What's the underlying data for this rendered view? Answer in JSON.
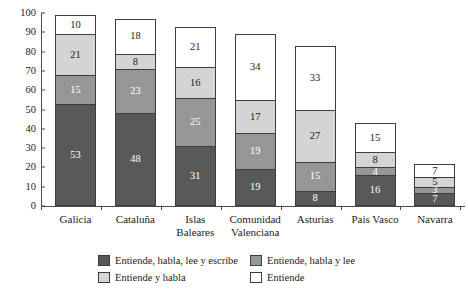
{
  "chart_data": {
    "type": "bar",
    "stacked": true,
    "title": "",
    "xlabel": "",
    "ylabel": "",
    "ylim": [
      0,
      100
    ],
    "yticks": [
      0,
      10,
      20,
      30,
      40,
      50,
      60,
      70,
      80,
      90,
      100
    ],
    "grid": false,
    "legend_position": "bottom",
    "categories": [
      "Galicia",
      "Cataluña",
      "Islas Baleares",
      "Comunidad Valenciana",
      "Asturias",
      "Pais Vasco",
      "Navarra"
    ],
    "category_lines": [
      [
        "Galicia"
      ],
      [
        "Cataluña"
      ],
      [
        "Islas",
        "Baleares"
      ],
      [
        "Comunidad",
        "Valenciana"
      ],
      [
        "Asturias"
      ],
      [
        "Pais Vasco"
      ],
      [
        "Navarra"
      ]
    ],
    "series": [
      {
        "name": "Entiende, habla, lee y escribe",
        "color": "#595959",
        "values": [
          53,
          48,
          31,
          19,
          8,
          16,
          7
        ]
      },
      {
        "name": "Entiende, habla y lee",
        "color": "#969696",
        "values": [
          15,
          23,
          25,
          19,
          15,
          4,
          3
        ]
      },
      {
        "name": "Entiende y habla",
        "color": "#d4d4d4",
        "values": [
          21,
          8,
          16,
          17,
          27,
          8,
          5
        ]
      },
      {
        "name": "Entiende",
        "color": "#ffffff",
        "values": [
          10,
          18,
          21,
          34,
          33,
          15,
          7
        ]
      }
    ],
    "totals": [
      99,
      97,
      93,
      89,
      83,
      43,
      22
    ]
  },
  "legend": {
    "items": [
      {
        "label": "Entiende, habla, lee y escribe",
        "color": "#595959"
      },
      {
        "label": "Entiende, habla y lee",
        "color": "#969696"
      },
      {
        "label": "Entiende y habla",
        "color": "#d4d4d4"
      },
      {
        "label": "Entiende",
        "color": "#ffffff"
      }
    ]
  }
}
